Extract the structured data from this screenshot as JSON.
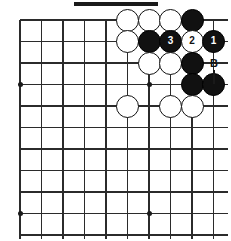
{
  "diagram": {
    "width": 231,
    "height": 241,
    "board": {
      "origin_x": 20,
      "origin_y": 20,
      "spacing": 21.5,
      "cols": 10,
      "rows": 11,
      "line_color": "#2b2b2b",
      "background_color": "#ffffff",
      "star_points": [
        {
          "col": 0,
          "row": 3
        },
        {
          "col": 6,
          "row": 3
        },
        {
          "col": 0,
          "row": 9
        },
        {
          "col": 6,
          "row": 9
        }
      ]
    },
    "top_bar": {
      "x": 74,
      "y": 2,
      "width": 84,
      "height": 4,
      "color": "#1a1a1a"
    },
    "stones": [
      {
        "col": 5,
        "row": 0,
        "color": "white",
        "label": ""
      },
      {
        "col": 6,
        "row": 0,
        "color": "white",
        "label": ""
      },
      {
        "col": 7,
        "row": 0,
        "color": "white",
        "label": ""
      },
      {
        "col": 8,
        "row": 0,
        "color": "black",
        "label": ""
      },
      {
        "col": 5,
        "row": 1,
        "color": "white",
        "label": ""
      },
      {
        "col": 6,
        "row": 1,
        "color": "black",
        "label": ""
      },
      {
        "col": 7,
        "row": 1,
        "color": "black",
        "label": "3"
      },
      {
        "col": 8,
        "row": 1,
        "color": "white",
        "label": "2"
      },
      {
        "col": 9,
        "row": 1,
        "color": "black",
        "label": "1"
      },
      {
        "col": 6,
        "row": 2,
        "color": "white",
        "label": ""
      },
      {
        "col": 7,
        "row": 2,
        "color": "white",
        "label": ""
      },
      {
        "col": 8,
        "row": 2,
        "color": "black",
        "label": ""
      },
      {
        "col": 8,
        "row": 3,
        "color": "black",
        "label": ""
      },
      {
        "col": 9,
        "row": 3,
        "color": "black",
        "label": ""
      },
      {
        "col": 5,
        "row": 4,
        "color": "white",
        "label": ""
      },
      {
        "col": 7,
        "row": 4,
        "color": "white",
        "label": ""
      },
      {
        "col": 8,
        "row": 4,
        "color": "white",
        "label": ""
      }
    ],
    "point_labels": [
      {
        "text": "A",
        "col": 9,
        "row": 0,
        "offset_x": 22,
        "stem": true
      },
      {
        "text": "B",
        "col": 8,
        "row": 2,
        "offset_x": 22,
        "stem": true
      }
    ],
    "move_numbers": [
      "1",
      "2",
      "3"
    ],
    "colors": {
      "black_stone": "#111111",
      "white_stone": "#ffffff",
      "line": "#2b2b2b",
      "label_text": "#111111"
    }
  }
}
